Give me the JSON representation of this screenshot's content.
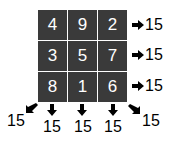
{
  "grid": [
    [
      "4",
      "9",
      "2"
    ],
    [
      "3",
      "5",
      "7"
    ],
    [
      "8",
      "1",
      "6"
    ]
  ],
  "row_sums": [
    "15",
    "15",
    "15"
  ],
  "column_sums": [
    "15",
    "15",
    "15"
  ],
  "diagonal_sums": {
    "anti": "15",
    "main": "15"
  },
  "colors": {
    "cell_bg": "#3a3a3a",
    "cell_text": "#ffffff",
    "label": "#000000"
  }
}
